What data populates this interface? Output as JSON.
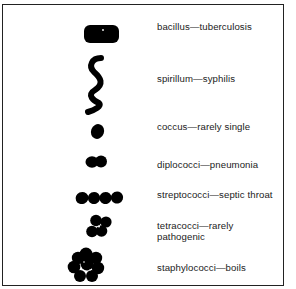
{
  "diagram": {
    "type": "bacteria-shapes-reference",
    "items": [
      {
        "shape": "bacillus",
        "label": "bacillus—tuberculosis",
        "icon": "rod-shape-icon"
      },
      {
        "shape": "spirillum",
        "label": "spirillum—syphilis",
        "icon": "spiral-shape-icon"
      },
      {
        "shape": "coccus",
        "label": "coccus—rarely single",
        "icon": "sphere-shape-icon"
      },
      {
        "shape": "diplococci",
        "label": "diplococci—pneumonia",
        "icon": "paired-spheres-icon"
      },
      {
        "shape": "streptococci",
        "label": "streptococci—septic throat",
        "icon": "chain-spheres-icon"
      },
      {
        "shape": "tetracocci",
        "label_line1": "tetracocci—rarely",
        "label_line2": "pathogenic",
        "icon": "four-spheres-icon"
      },
      {
        "shape": "staphylococci",
        "label": "staphylococci—boils",
        "icon": "cluster-spheres-icon"
      }
    ],
    "colors": {
      "ink": "#000000",
      "background": "#ffffff",
      "border": "#222222"
    }
  }
}
